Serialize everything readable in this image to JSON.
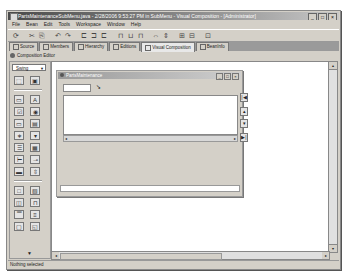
{
  "window": {
    "title": "PartsMaintenanceSubMenu.java - 2/28/2006 9:53:27 PM in SubMenu - Visual Composition - [Administrator]",
    "controls": {
      "minimize": "_",
      "maximize": "□",
      "close": "×"
    }
  },
  "menubar": {
    "items": [
      "File",
      "Bean",
      "Edit",
      "Tools",
      "Workspace",
      "Window",
      "Help"
    ]
  },
  "toolbar": {
    "icons": [
      "run-icon",
      "cut-icon",
      "copy-icon",
      "undo-icon",
      "redo-icon",
      "align-left-icon",
      "align-center-icon",
      "align-right-icon",
      "align-top-icon",
      "align-middle-icon",
      "align-bottom-icon",
      "distribute-icon",
      "match-width-icon",
      "match-height-icon",
      "properties-icon",
      "connections-icon",
      "test-icon"
    ],
    "glyphs": [
      "⟳",
      "✂",
      "⎘",
      "↶",
      "↷",
      "⊏",
      "⊐",
      "⊏",
      "⊓",
      "⊔",
      "⊓",
      "⇔",
      "⇕",
      "⊞",
      "⊟",
      "⊡",
      "▶"
    ]
  },
  "tabs": [
    {
      "label": "Source",
      "active": false
    },
    {
      "label": "Members",
      "active": false
    },
    {
      "label": "Hierarchy",
      "active": false
    },
    {
      "label": "Editions",
      "active": false
    },
    {
      "label": "Visual Composition",
      "active": true
    },
    {
      "label": "BeanInfo",
      "active": false
    }
  ],
  "editor": {
    "label": "Composition Editor"
  },
  "palette": {
    "category": "Swing",
    "items": [
      {
        "name": "selection-tool",
        "glyph": "⬚"
      },
      {
        "name": "choose-bean",
        "glyph": "▣"
      },
      {
        "name": "jbutton",
        "glyph": "▭"
      },
      {
        "name": "jlabel",
        "glyph": "A"
      },
      {
        "name": "jcheckbox",
        "glyph": "☑"
      },
      {
        "name": "jradiobutton",
        "glyph": "◉"
      },
      {
        "name": "jtextfield",
        "glyph": "▭"
      },
      {
        "name": "jtextarea",
        "glyph": "▤"
      },
      {
        "name": "jpasswordfield",
        "glyph": "∗"
      },
      {
        "name": "jcombobox",
        "glyph": "▾"
      },
      {
        "name": "jlist",
        "glyph": "☰"
      },
      {
        "name": "jtable",
        "glyph": "▦"
      },
      {
        "name": "jtree",
        "glyph": "⊢"
      },
      {
        "name": "jslider",
        "glyph": "⊸"
      },
      {
        "name": "jprogressbar",
        "glyph": "▬"
      },
      {
        "name": "jscrollbar",
        "glyph": "⇳"
      },
      {
        "name": "jpanel",
        "glyph": "□"
      },
      {
        "name": "jscrollpane",
        "glyph": "▧"
      },
      {
        "name": "jsplitpane",
        "glyph": "◫"
      },
      {
        "name": "jtabbedpane",
        "glyph": "⊓"
      },
      {
        "name": "jtoolbar",
        "glyph": "▔"
      },
      {
        "name": "jmenubar",
        "glyph": "≡"
      },
      {
        "name": "jframe",
        "glyph": "▢"
      },
      {
        "name": "jinternalframe",
        "glyph": "◱"
      }
    ],
    "more_arrow": "▼"
  },
  "internal_frame": {
    "title": "PartsMaintenance",
    "controls": {
      "minimize": "_",
      "maximize": "□",
      "close": "×"
    },
    "field_value": "",
    "text_value": "",
    "nav_buttons": [
      {
        "name": "first-record-button",
        "glyph": "|◀"
      },
      {
        "name": "previous-record-button",
        "glyph": "▴"
      },
      {
        "name": "next-record-button",
        "glyph": "▾"
      },
      {
        "name": "last-record-button",
        "glyph": "▶|"
      }
    ],
    "scroll_left": "◂",
    "scroll_right": "▸"
  },
  "scrollbars": {
    "up": "▴",
    "down": "▾",
    "left": "◂",
    "right": "▸"
  },
  "status": {
    "text": "Nothing selected"
  }
}
